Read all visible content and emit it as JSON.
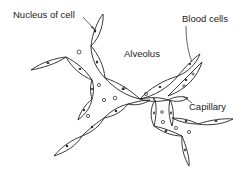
{
  "diagram": {
    "labels": {
      "nucleus": "Nucleus of cell",
      "alveolus": "Alveolus",
      "blood_cells": "Blood cells",
      "capillary": "Capillary"
    },
    "colors": {
      "line": "#222222",
      "background": "#ffffff"
    }
  }
}
